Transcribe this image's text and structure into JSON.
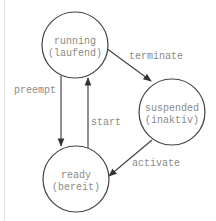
{
  "diagram": {
    "type": "state-machine",
    "states": [
      {
        "id": "running",
        "line1": "running",
        "line2": "(laufend)"
      },
      {
        "id": "suspended",
        "line1": "suspended",
        "line2": "(inaktiv)"
      },
      {
        "id": "ready",
        "line1": "ready",
        "line2": "(bereit)"
      }
    ],
    "transitions": [
      {
        "from": "running",
        "to": "suspended",
        "label": "terminate"
      },
      {
        "from": "running",
        "to": "ready",
        "label": "preempt"
      },
      {
        "from": "ready",
        "to": "running",
        "label": "start"
      },
      {
        "from": "suspended",
        "to": "ready",
        "label": "activate"
      }
    ],
    "colors": {
      "stroke": "#444444",
      "text": "#8a8a8a",
      "background": "#ffffff"
    }
  }
}
